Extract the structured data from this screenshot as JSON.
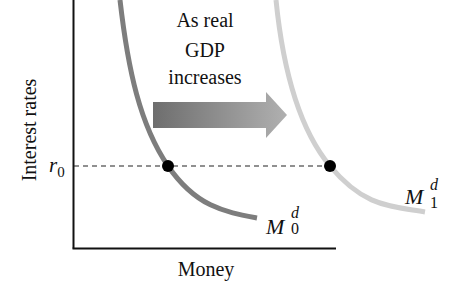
{
  "diagram": {
    "y_axis_label": "Interest rates",
    "x_axis_label": "Money",
    "rate_label": {
      "symbol": "r",
      "subscript": "0"
    },
    "annotation": {
      "line1": "As real",
      "line2": "GDP",
      "line3": "increases"
    },
    "curves": [
      {
        "id": "M0",
        "base": "M",
        "superscript": "d",
        "subscript": "0",
        "color": "#7d7d7d"
      },
      {
        "id": "M1",
        "base": "M",
        "superscript": "d",
        "subscript": "1",
        "color": "#cfcfcf"
      }
    ],
    "colors": {
      "axis": "#111111",
      "dashed_line": "#222222",
      "dot": "#000000",
      "arrow_start": "#6e6e6e",
      "arrow_end": "#b3b3b3"
    }
  }
}
